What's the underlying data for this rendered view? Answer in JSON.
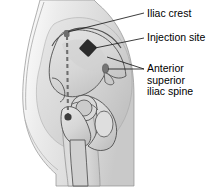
{
  "figure": {
    "view": "lateral hip and pelvis",
    "background_color": "#ffffff"
  },
  "labels": [
    {
      "id": "iliac-crest",
      "text": "Iliac crest",
      "lines": [
        "Iliac crest"
      ],
      "x": 147,
      "y": 8,
      "leader_from": [
        144,
        13
      ],
      "leader_to": [
        67,
        33
      ]
    },
    {
      "id": "injection-site",
      "text": "Injection site",
      "lines": [
        "Injection site"
      ],
      "x": 147,
      "y": 32,
      "leader_from": [
        144,
        38
      ],
      "leader_to": [
        95,
        48
      ]
    },
    {
      "id": "anterior-superior-iliac-spine",
      "text": "Anterior superior iliac spine",
      "lines": [
        "Anterior",
        "superior",
        "iliac spine"
      ],
      "x": 147,
      "y": 63,
      "leader_from": [
        144,
        69
      ],
      "leader_to": [
        106,
        67
      ]
    }
  ],
  "markers": {
    "injection_site": {
      "name": "injection-site-diamond",
      "shape": "diamond",
      "color": "#2b2b2b",
      "cx": 88,
      "cy": 48,
      "size": 13
    },
    "iliac_crest_dot": {
      "name": "iliac-crest-marker",
      "shape": "square",
      "color": "#6b6b6b",
      "cx": 67,
      "cy": 33
    },
    "asis_dot": {
      "name": "asis-marker",
      "shape": "oval",
      "color": "#6b6b6b",
      "cx": 105,
      "cy": 68
    },
    "trochanter_dot": {
      "name": "greater-trochanter-marker",
      "shape": "circle",
      "color": "#4a4a4a",
      "cx": 68,
      "cy": 118
    }
  },
  "guides": {
    "midline": {
      "name": "dashed-midline",
      "style": "dashed",
      "color": "#6b6b6b",
      "from": [
        67,
        36
      ],
      "to": [
        68,
        116
      ]
    }
  },
  "colors": {
    "skin_light": "#e8e8e8",
    "skin_mid": "#d2d2d2",
    "skin_shadow": "#bcbcbc",
    "bone_fill": "#dcdcdc",
    "bone_shadow": "#c4c4c4",
    "outline": "#555555",
    "marker_dark": "#2b2b2b",
    "text": "#000000"
  }
}
